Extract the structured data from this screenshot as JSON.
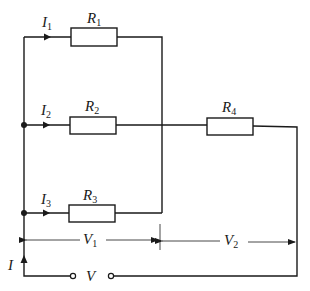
{
  "diagram": {
    "type": "electrical-circuit",
    "colors": {
      "line": "#1a1a1a",
      "background": "#ffffff"
    },
    "resistors": [
      {
        "id": "R1",
        "label": "R",
        "sub": "1"
      },
      {
        "id": "R2",
        "label": "R",
        "sub": "2"
      },
      {
        "id": "R3",
        "label": "R",
        "sub": "3"
      },
      {
        "id": "R4",
        "label": "R",
        "sub": "4"
      }
    ],
    "currents": [
      {
        "id": "I1",
        "label": "I",
        "sub": "1"
      },
      {
        "id": "I2",
        "label": "I",
        "sub": "2"
      },
      {
        "id": "I3",
        "label": "I",
        "sub": "3"
      },
      {
        "id": "I",
        "label": "I",
        "sub": ""
      }
    ],
    "voltages": [
      {
        "id": "V1",
        "label": "V",
        "sub": "1"
      },
      {
        "id": "V2",
        "label": "V",
        "sub": "2"
      },
      {
        "id": "V",
        "label": "V",
        "sub": ""
      }
    ]
  }
}
